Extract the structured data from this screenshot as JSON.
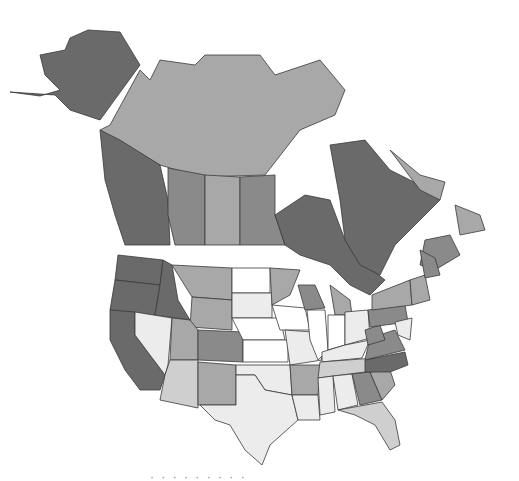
{
  "map": {
    "type": "choropleth",
    "subject": "North America (United States states and Canadian provinces/territories)",
    "color_scale": {
      "level_1": "#6a6a6a",
      "level_2": "#8a8a8a",
      "level_3": "#a8a8a8",
      "level_4": "#cfcfcf",
      "level_5": "#ececec",
      "level_0": "#ffffff"
    },
    "legend": null,
    "regions": [
      {
        "id": "AK",
        "name": "Alaska",
        "level": 1
      },
      {
        "id": "YT_NT_NU",
        "name": "Yukon / Northwest Territories / Nunavut",
        "level": 3
      },
      {
        "id": "BC",
        "name": "British Columbia",
        "level": 1
      },
      {
        "id": "AB",
        "name": "Alberta",
        "level": 2
      },
      {
        "id": "SK",
        "name": "Saskatchewan",
        "level": 3
      },
      {
        "id": "MB",
        "name": "Manitoba",
        "level": 2
      },
      {
        "id": "ON",
        "name": "Ontario",
        "level": 1
      },
      {
        "id": "QC",
        "name": "Quebec",
        "level": 1
      },
      {
        "id": "NL",
        "name": "Newfoundland and Labrador",
        "level": 3
      },
      {
        "id": "MAR",
        "name": "Maritime Provinces",
        "level": 2
      },
      {
        "id": "WA",
        "name": "Washington",
        "level": 1
      },
      {
        "id": "OR",
        "name": "Oregon",
        "level": 1
      },
      {
        "id": "CA",
        "name": "California",
        "level": 1
      },
      {
        "id": "ID",
        "name": "Idaho",
        "level": 1
      },
      {
        "id": "NV",
        "name": "Nevada",
        "level": 5
      },
      {
        "id": "MT",
        "name": "Montana",
        "level": 3
      },
      {
        "id": "WY",
        "name": "Wyoming",
        "level": 3
      },
      {
        "id": "UT",
        "name": "Utah",
        "level": 3
      },
      {
        "id": "AZ",
        "name": "Arizona",
        "level": 4
      },
      {
        "id": "CO",
        "name": "Colorado",
        "level": 2
      },
      {
        "id": "NM",
        "name": "New Mexico",
        "level": 3
      },
      {
        "id": "ND",
        "name": "North Dakota",
        "level": 0
      },
      {
        "id": "SD",
        "name": "South Dakota",
        "level": 5
      },
      {
        "id": "NE",
        "name": "Nebraska",
        "level": 0
      },
      {
        "id": "KS",
        "name": "Kansas",
        "level": 0
      },
      {
        "id": "OK",
        "name": "Oklahoma",
        "level": 5
      },
      {
        "id": "TX",
        "name": "Texas",
        "level": 5
      },
      {
        "id": "MN",
        "name": "Minnesota",
        "level": 3
      },
      {
        "id": "IA",
        "name": "Iowa",
        "level": 0
      },
      {
        "id": "MO",
        "name": "Missouri",
        "level": 5
      },
      {
        "id": "AR",
        "name": "Arkansas",
        "level": 3
      },
      {
        "id": "LA",
        "name": "Louisiana",
        "level": 5
      },
      {
        "id": "WI",
        "name": "Wisconsin",
        "level": 2
      },
      {
        "id": "IL",
        "name": "Illinois",
        "level": 0
      },
      {
        "id": "MI",
        "name": "Michigan",
        "level": 3
      },
      {
        "id": "IN",
        "name": "Indiana",
        "level": 0
      },
      {
        "id": "OH",
        "name": "Ohio",
        "level": 5
      },
      {
        "id": "KY",
        "name": "Kentucky",
        "level": 5
      },
      {
        "id": "TN",
        "name": "Tennessee",
        "level": 4
      },
      {
        "id": "MS",
        "name": "Mississippi",
        "level": 5
      },
      {
        "id": "AL",
        "name": "Alabama",
        "level": 5
      },
      {
        "id": "GA",
        "name": "Georgia",
        "level": 2
      },
      {
        "id": "FL",
        "name": "Florida",
        "level": 4
      },
      {
        "id": "SC",
        "name": "South Carolina",
        "level": 3
      },
      {
        "id": "NC",
        "name": "North Carolina",
        "level": 1
      },
      {
        "id": "VA",
        "name": "Virginia",
        "level": 2
      },
      {
        "id": "WV",
        "name": "West Virginia",
        "level": 2
      },
      {
        "id": "PA",
        "name": "Pennsylvania",
        "level": 2
      },
      {
        "id": "NY",
        "name": "New York",
        "level": 3
      },
      {
        "id": "NE_US",
        "name": "New England",
        "level": 3
      },
      {
        "id": "ME",
        "name": "Maine",
        "level": 2
      },
      {
        "id": "MID_ATL",
        "name": "NJ / DE / MD",
        "level": 5
      }
    ]
  },
  "caption": "· · · · · · · · ·"
}
